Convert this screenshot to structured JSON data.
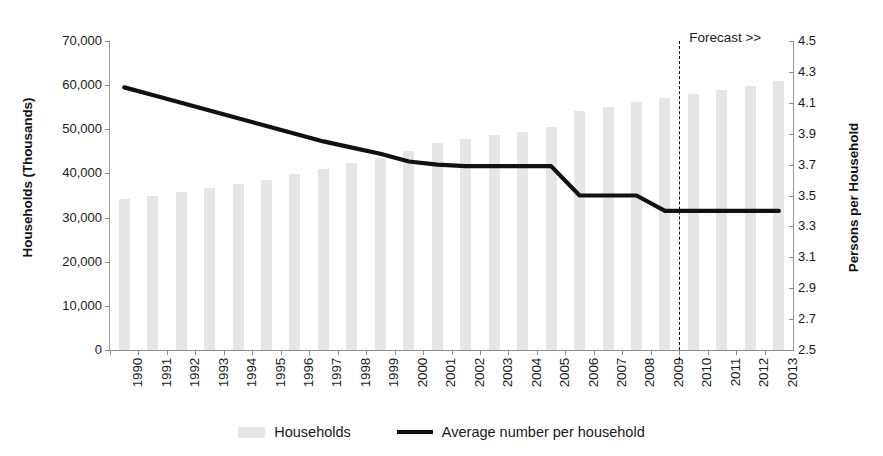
{
  "chart_data": {
    "type": "bar",
    "title": "",
    "subtitle": "",
    "xlabel": "",
    "ylabel": "Households (Thousands)",
    "y2label": "Persons per Household",
    "grid": false,
    "legend_position": "bottom",
    "categories": [
      "1990",
      "1991",
      "1992",
      "1993",
      "1994",
      "1995",
      "1996",
      "1997",
      "1998",
      "1999",
      "2000",
      "2001",
      "2002",
      "2003",
      "2004",
      "2005",
      "2006",
      "2007",
      "2008",
      "2009",
      "2010",
      "2011",
      "2012",
      "2013"
    ],
    "ylim": [
      0,
      70000
    ],
    "yticks": [
      0,
      10000,
      20000,
      30000,
      40000,
      50000,
      60000,
      70000
    ],
    "ytick_labels": [
      "0",
      "10,000",
      "20,000",
      "30,000",
      "40,000",
      "50,000",
      "60,000",
      "70,000"
    ],
    "y2lim": [
      2.5,
      4.5
    ],
    "y2ticks": [
      2.5,
      2.7,
      2.9,
      3.1,
      3.3,
      3.5,
      3.7,
      3.9,
      4.1,
      4.3,
      4.5
    ],
    "y2tick_labels": [
      "2.5",
      "2.7",
      "2.9",
      "3.1",
      "3.3",
      "3.5",
      "3.7",
      "3.9",
      "4.1",
      "4.3",
      "4.5"
    ],
    "series": [
      {
        "name": "Households",
        "type": "bar",
        "axis": "left",
        "color": "#e6e6e6",
        "values": [
          34200,
          34800,
          35700,
          36600,
          37700,
          38600,
          39900,
          41100,
          42300,
          43500,
          45100,
          46800,
          47800,
          48700,
          49500,
          50500,
          54200,
          55100,
          56100,
          57000,
          57900,
          58900,
          59900,
          60900
        ]
      },
      {
        "name": "Average number per household",
        "type": "line",
        "axis": "right",
        "color": "#111111",
        "values": [
          4.2,
          4.15,
          4.1,
          4.05,
          4.0,
          3.95,
          3.9,
          3.85,
          3.81,
          3.77,
          3.72,
          3.7,
          3.69,
          3.69,
          3.69,
          3.69,
          3.5,
          3.5,
          3.5,
          3.4,
          3.4,
          3.4,
          3.4,
          3.4
        ]
      }
    ],
    "annotations": [
      {
        "name": "forecast-divider",
        "label": "Forecast >>",
        "after_category": "2009",
        "style": "dashed-vertical-line"
      }
    ],
    "legend": [
      {
        "label": "Households",
        "marker": "bar-swatch",
        "color": "#e6e6e6"
      },
      {
        "label": "Average number per household",
        "marker": "line-swatch",
        "color": "#111111"
      }
    ]
  }
}
